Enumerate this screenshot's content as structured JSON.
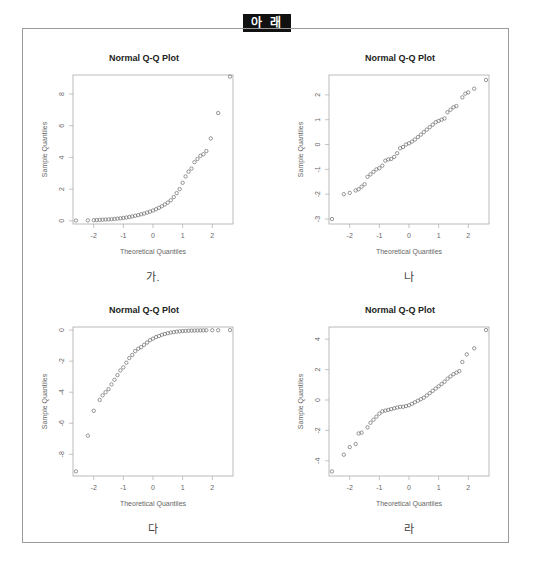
{
  "header": {
    "label": "아 래"
  },
  "panels": [
    {
      "title": "Normal Q-Q Plot",
      "xlabel": "Theoretical Quantiles",
      "ylabel": "Sample Quantiles",
      "caption": "가."
    },
    {
      "title": "Normal Q-Q Plot",
      "xlabel": "Theoretical Quantiles",
      "ylabel": "Sample Quantiles",
      "caption": "나"
    },
    {
      "title": "Normal Q-Q Plot",
      "xlabel": "Theoretical Quantiles",
      "ylabel": "Sample Quantiles",
      "caption": "다"
    },
    {
      "title": "Normal Q-Q Plot",
      "xlabel": "Theoretical Quantiles",
      "ylabel": "Sample Quantiles",
      "caption": "라"
    }
  ],
  "chart_data": [
    {
      "type": "scatter",
      "title": "Normal Q-Q Plot",
      "caption": "가.",
      "xlabel": "Theoretical Quantiles",
      "ylabel": "Sample Quantiles",
      "xlim": [
        -2.7,
        2.7
      ],
      "ylim": [
        -0.2,
        9.2
      ],
      "xticks": [
        -2,
        -1,
        0,
        1,
        2
      ],
      "yticks": [
        0,
        2,
        4,
        6,
        8
      ],
      "shape": "right-skewed",
      "points": [
        [
          -2.6,
          0.02
        ],
        [
          -2.2,
          0.03
        ],
        [
          -2.0,
          0.04
        ],
        [
          -1.9,
          0.05
        ],
        [
          -1.8,
          0.06
        ],
        [
          -1.7,
          0.07
        ],
        [
          -1.6,
          0.08
        ],
        [
          -1.5,
          0.09
        ],
        [
          -1.4,
          0.1
        ],
        [
          -1.3,
          0.12
        ],
        [
          -1.2,
          0.14
        ],
        [
          -1.1,
          0.16
        ],
        [
          -1.0,
          0.18
        ],
        [
          -0.9,
          0.21
        ],
        [
          -0.8,
          0.24
        ],
        [
          -0.7,
          0.28
        ],
        [
          -0.6,
          0.32
        ],
        [
          -0.5,
          0.36
        ],
        [
          -0.4,
          0.41
        ],
        [
          -0.3,
          0.46
        ],
        [
          -0.2,
          0.52
        ],
        [
          -0.1,
          0.58
        ],
        [
          0.0,
          0.65
        ],
        [
          0.1,
          0.73
        ],
        [
          0.2,
          0.82
        ],
        [
          0.3,
          0.92
        ],
        [
          0.4,
          1.03
        ],
        [
          0.5,
          1.15
        ],
        [
          0.6,
          1.3
        ],
        [
          0.7,
          1.5
        ],
        [
          0.8,
          1.75
        ],
        [
          0.9,
          2.0
        ],
        [
          1.0,
          2.4
        ],
        [
          1.1,
          2.8
        ],
        [
          1.2,
          3.1
        ],
        [
          1.3,
          3.3
        ],
        [
          1.4,
          3.7
        ],
        [
          1.5,
          3.9
        ],
        [
          1.6,
          4.1
        ],
        [
          1.7,
          4.2
        ],
        [
          1.8,
          4.4
        ],
        [
          1.95,
          5.2
        ],
        [
          2.2,
          6.8
        ],
        [
          2.6,
          9.1
        ]
      ]
    },
    {
      "type": "scatter",
      "title": "Normal Q-Q Plot",
      "caption": "나",
      "xlabel": "Theoretical Quantiles",
      "ylabel": "Sample Quantiles",
      "xlim": [
        -2.7,
        2.7
      ],
      "ylim": [
        -3.2,
        2.8
      ],
      "xticks": [
        -2,
        -1,
        0,
        1,
        2
      ],
      "yticks": [
        -3,
        -2,
        -1,
        0,
        1,
        2
      ],
      "shape": "normal",
      "points": [
        [
          -2.6,
          -3.0
        ],
        [
          -2.2,
          -2.0
        ],
        [
          -2.0,
          -1.95
        ],
        [
          -1.8,
          -1.85
        ],
        [
          -1.7,
          -1.8
        ],
        [
          -1.6,
          -1.7
        ],
        [
          -1.5,
          -1.6
        ],
        [
          -1.4,
          -1.3
        ],
        [
          -1.3,
          -1.2
        ],
        [
          -1.2,
          -1.1
        ],
        [
          -1.1,
          -1.0
        ],
        [
          -1.0,
          -0.95
        ],
        [
          -0.9,
          -0.85
        ],
        [
          -0.8,
          -0.65
        ],
        [
          -0.7,
          -0.6
        ],
        [
          -0.6,
          -0.58
        ],
        [
          -0.5,
          -0.5
        ],
        [
          -0.4,
          -0.35
        ],
        [
          -0.3,
          -0.15
        ],
        [
          -0.2,
          -0.1
        ],
        [
          -0.1,
          0.0
        ],
        [
          0.0,
          0.05
        ],
        [
          0.1,
          0.12
        ],
        [
          0.2,
          0.2
        ],
        [
          0.3,
          0.3
        ],
        [
          0.4,
          0.4
        ],
        [
          0.5,
          0.5
        ],
        [
          0.6,
          0.6
        ],
        [
          0.7,
          0.7
        ],
        [
          0.8,
          0.8
        ],
        [
          0.9,
          0.9
        ],
        [
          1.0,
          0.95
        ],
        [
          1.1,
          1.0
        ],
        [
          1.2,
          1.05
        ],
        [
          1.3,
          1.3
        ],
        [
          1.4,
          1.4
        ],
        [
          1.5,
          1.5
        ],
        [
          1.6,
          1.55
        ],
        [
          1.8,
          1.9
        ],
        [
          1.9,
          2.05
        ],
        [
          2.0,
          2.1
        ],
        [
          2.2,
          2.25
        ],
        [
          2.6,
          2.6
        ]
      ]
    },
    {
      "type": "scatter",
      "title": "Normal Q-Q Plot",
      "caption": "다",
      "xlabel": "Theoretical Quantiles",
      "ylabel": "Sample Quantiles",
      "xlim": [
        -2.7,
        2.7
      ],
      "ylim": [
        -9.4,
        0.2
      ],
      "xticks": [
        -2,
        -1,
        0,
        1,
        2
      ],
      "yticks": [
        -8,
        -6,
        -4,
        -2,
        0
      ],
      "shape": "left-skewed",
      "points": [
        [
          -2.6,
          -9.1
        ],
        [
          -2.2,
          -6.8
        ],
        [
          -2.0,
          -5.2
        ],
        [
          -1.8,
          -4.5
        ],
        [
          -1.7,
          -4.2
        ],
        [
          -1.6,
          -4.0
        ],
        [
          -1.5,
          -3.8
        ],
        [
          -1.4,
          -3.5
        ],
        [
          -1.3,
          -3.2
        ],
        [
          -1.2,
          -2.9
        ],
        [
          -1.1,
          -2.6
        ],
        [
          -1.0,
          -2.4
        ],
        [
          -0.9,
          -2.1
        ],
        [
          -0.8,
          -1.8
        ],
        [
          -0.7,
          -1.6
        ],
        [
          -0.6,
          -1.35
        ],
        [
          -0.5,
          -1.2
        ],
        [
          -0.4,
          -1.1
        ],
        [
          -0.3,
          -0.95
        ],
        [
          -0.2,
          -0.8
        ],
        [
          -0.1,
          -0.65
        ],
        [
          0.0,
          -0.55
        ],
        [
          0.1,
          -0.45
        ],
        [
          0.2,
          -0.38
        ],
        [
          0.3,
          -0.3
        ],
        [
          0.4,
          -0.25
        ],
        [
          0.5,
          -0.2
        ],
        [
          0.6,
          -0.16
        ],
        [
          0.7,
          -0.13
        ],
        [
          0.8,
          -0.1
        ],
        [
          0.9,
          -0.08
        ],
        [
          1.0,
          -0.06
        ],
        [
          1.1,
          -0.05
        ],
        [
          1.2,
          -0.04
        ],
        [
          1.3,
          -0.03
        ],
        [
          1.4,
          -0.03
        ],
        [
          1.5,
          -0.02
        ],
        [
          1.6,
          -0.02
        ],
        [
          1.7,
          -0.02
        ],
        [
          1.8,
          -0.01
        ],
        [
          2.0,
          -0.01
        ],
        [
          2.2,
          -0.01
        ],
        [
          2.6,
          0.0
        ]
      ]
    },
    {
      "type": "scatter",
      "title": "Normal Q-Q Plot",
      "caption": "라",
      "xlabel": "Theoretical Quantiles",
      "ylabel": "Sample Quantiles",
      "xlim": [
        -2.7,
        2.7
      ],
      "ylim": [
        -5.0,
        4.8
      ],
      "xticks": [
        -2,
        -1,
        0,
        1,
        2
      ],
      "yticks": [
        -4,
        -2,
        0,
        2,
        4
      ],
      "shape": "heavy-tailed",
      "points": [
        [
          -2.6,
          -4.7
        ],
        [
          -2.2,
          -3.6
        ],
        [
          -2.0,
          -3.1
        ],
        [
          -1.8,
          -2.9
        ],
        [
          -1.7,
          -2.2
        ],
        [
          -1.6,
          -2.15
        ],
        [
          -1.4,
          -1.8
        ],
        [
          -1.3,
          -1.5
        ],
        [
          -1.2,
          -1.3
        ],
        [
          -1.1,
          -1.1
        ],
        [
          -1.0,
          -0.9
        ],
        [
          -0.9,
          -0.75
        ],
        [
          -0.8,
          -0.7
        ],
        [
          -0.7,
          -0.65
        ],
        [
          -0.6,
          -0.6
        ],
        [
          -0.5,
          -0.55
        ],
        [
          -0.4,
          -0.5
        ],
        [
          -0.3,
          -0.45
        ],
        [
          -0.2,
          -0.45
        ],
        [
          -0.1,
          -0.4
        ],
        [
          0.0,
          -0.35
        ],
        [
          0.1,
          -0.25
        ],
        [
          0.2,
          -0.15
        ],
        [
          0.3,
          -0.05
        ],
        [
          0.4,
          0.05
        ],
        [
          0.5,
          0.15
        ],
        [
          0.6,
          0.3
        ],
        [
          0.7,
          0.45
        ],
        [
          0.8,
          0.6
        ],
        [
          0.9,
          0.75
        ],
        [
          1.0,
          0.9
        ],
        [
          1.1,
          1.05
        ],
        [
          1.2,
          1.2
        ],
        [
          1.3,
          1.4
        ],
        [
          1.4,
          1.55
        ],
        [
          1.5,
          1.7
        ],
        [
          1.6,
          1.8
        ],
        [
          1.7,
          1.9
        ],
        [
          1.8,
          2.5
        ],
        [
          1.95,
          3.0
        ],
        [
          2.2,
          3.4
        ],
        [
          2.6,
          4.6
        ]
      ]
    }
  ]
}
